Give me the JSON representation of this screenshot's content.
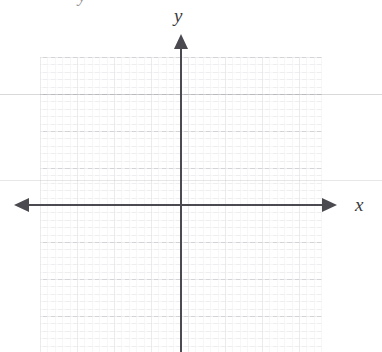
{
  "figure": {
    "kind": "coordinate-plane"
  },
  "labels": {
    "y_axis": "y",
    "x_axis": "x",
    "clipped_top_glyph": "y"
  },
  "colors": {
    "axis": "#4a4a50",
    "grid_major": "#96969f",
    "grid_minor": "#aaaab4",
    "label": "#3a3a40",
    "background": "#ffffff",
    "scan_artifact": "#787882"
  },
  "chart_data": {
    "type": "scatter",
    "title": "",
    "xlabel": "x",
    "ylabel": "y",
    "x": [],
    "y": [],
    "series": [],
    "xlim": [
      -9,
      9
    ],
    "ylim": [
      -9,
      9
    ],
    "grid": true,
    "legend": "none",
    "annotations": [],
    "axis_arrows": [
      "left",
      "right",
      "up"
    ],
    "origin_px": [
      181,
      205
    ],
    "grid_cell_px": 37
  }
}
